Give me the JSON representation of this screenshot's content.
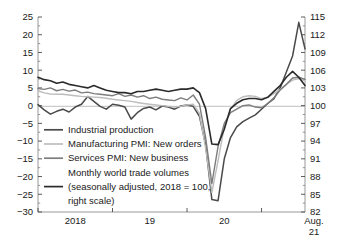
{
  "chart_data": {
    "type": "line",
    "title": "",
    "subtitle": "",
    "xlabel": "",
    "ylabel": "",
    "grid": false,
    "legend_position": "inside-lower-left",
    "x_tick_labels": [
      "2018",
      "19",
      "20",
      "Aug.",
      "21"
    ],
    "left_axis": {
      "label": "",
      "ylim": [
        -30,
        25
      ],
      "ticks": [
        25,
        20,
        15,
        10,
        5,
        0,
        -5,
        -10,
        -15,
        -20,
        -25,
        -30
      ],
      "tick_labels": [
        "25",
        "20",
        "15",
        "10",
        "5",
        "0",
        "−5",
        "−10",
        "−15",
        "−20",
        "−25",
        "−30"
      ]
    },
    "right_axis": {
      "label": "",
      "ylim": [
        82,
        115
      ],
      "ticks": [
        115,
        112,
        109,
        106,
        103,
        100,
        97,
        94,
        91,
        88,
        85,
        82
      ],
      "tick_labels": [
        "115",
        "112",
        "109",
        "106",
        "103",
        "100",
        "97",
        "94",
        "91",
        "88",
        "85",
        "82"
      ]
    },
    "zero_line_value": 0,
    "series": [
      {
        "name": "Industrial production",
        "axis": "left",
        "color": "#4a4a4a",
        "width": 1.5,
        "x": [
          0,
          1,
          2,
          3,
          4,
          5,
          6,
          7,
          8,
          9,
          10,
          11,
          12,
          13,
          14,
          15,
          16,
          17,
          18,
          19,
          20,
          21,
          22,
          23,
          24,
          25,
          26,
          27,
          28,
          29,
          30,
          31,
          32,
          33,
          34,
          35,
          36,
          37,
          38,
          39,
          40,
          41,
          42,
          43
        ],
        "values": [
          0.3,
          -1.2,
          -2.4,
          -1.6,
          -1.0,
          -1.8,
          -0.4,
          0.4,
          2.6,
          1.2,
          -0.2,
          -1.0,
          0.4,
          0.1,
          -0.4,
          -3.8,
          -2.0,
          -0.8,
          -0.4,
          -1.2,
          -0.1,
          -0.4,
          -1.0,
          -0.1,
          0.2,
          -0.2,
          -3.0,
          -11.0,
          -26.5,
          -26.8,
          -15.0,
          -9.0,
          -6.0,
          -4.5,
          -3.5,
          -2.6,
          -1.0,
          0.6,
          2.0,
          5.0,
          9.5,
          14.0,
          23.5,
          16.0
        ]
      },
      {
        "name": "Manufacturing PMI: New orders",
        "axis": "left",
        "color": "#bdbdbd",
        "width": 1.4,
        "x": [
          0,
          1,
          2,
          3,
          4,
          5,
          6,
          7,
          8,
          9,
          10,
          11,
          12,
          13,
          14,
          15,
          16,
          17,
          18,
          19,
          20,
          21,
          22,
          23,
          24,
          25,
          26,
          27,
          28,
          29,
          30,
          31,
          32,
          33,
          34,
          35,
          36,
          37,
          38,
          39,
          40,
          41,
          42,
          43
        ],
        "values": [
          4.2,
          3.6,
          3.3,
          3.2,
          3.2,
          3.0,
          2.8,
          2.6,
          2.5,
          2.4,
          2.3,
          2.1,
          1.8,
          1.6,
          1.4,
          1.2,
          0.9,
          0.6,
          0.4,
          0.2,
          0.0,
          -0.2,
          -0.4,
          -0.2,
          0.2,
          0.4,
          -2.2,
          -12.0,
          -24.5,
          -15.5,
          -6.0,
          -1.0,
          1.5,
          2.5,
          2.8,
          2.6,
          2.0,
          2.4,
          3.4,
          4.6,
          6.0,
          7.2,
          7.6,
          7.0
        ]
      },
      {
        "name": "Services PMI: New business",
        "axis": "left",
        "color": "#7d7d7d",
        "width": 1.4,
        "x": [
          0,
          1,
          2,
          3,
          4,
          5,
          6,
          7,
          8,
          9,
          10,
          11,
          12,
          13,
          14,
          15,
          16,
          17,
          18,
          19,
          20,
          21,
          22,
          23,
          24,
          25,
          26,
          27,
          28,
          29,
          30,
          31,
          32,
          33,
          34,
          35,
          36,
          37,
          38,
          39,
          40,
          41,
          42,
          43
        ],
        "values": [
          4.8,
          4.6,
          5.0,
          4.2,
          4.6,
          4.1,
          4.4,
          3.6,
          3.8,
          3.4,
          3.2,
          3.0,
          2.8,
          3.4,
          2.6,
          3.0,
          2.4,
          2.8,
          2.0,
          2.4,
          1.8,
          1.6,
          1.4,
          2.2,
          1.6,
          3.0,
          0.4,
          -9.0,
          -22.0,
          -11.5,
          -5.0,
          -2.0,
          -1.0,
          0.0,
          0.2,
          -0.4,
          -0.6,
          0.6,
          2.2,
          4.4,
          6.0,
          7.8,
          8.0,
          7.4
        ]
      },
      {
        "name": "Monthly world trade volumes",
        "axis": "right",
        "color": "#2b2b2b",
        "width": 1.6,
        "x": [
          0,
          1,
          2,
          3,
          4,
          5,
          6,
          7,
          8,
          9,
          10,
          11,
          12,
          13,
          14,
          15,
          16,
          17,
          18,
          19,
          20,
          21,
          22,
          23,
          24,
          25,
          26,
          27,
          28,
          29,
          30,
          31,
          32,
          33,
          34,
          35,
          36,
          37,
          38,
          39,
          40,
          41,
          42,
          43
        ],
        "values": [
          104.8,
          104.4,
          104.2,
          103.8,
          104.0,
          103.6,
          103.4,
          103.2,
          103.0,
          103.4,
          103.0,
          102.6,
          102.4,
          102.2,
          102.2,
          102.0,
          102.4,
          102.4,
          102.6,
          102.8,
          102.6,
          102.4,
          102.6,
          102.8,
          102.8,
          103.0,
          102.2,
          99.5,
          93.5,
          93.4,
          96.0,
          99.5,
          100.4,
          101.0,
          101.2,
          101.2,
          101.0,
          101.4,
          102.4,
          103.4,
          104.8,
          105.8,
          104.8,
          103.4
        ]
      }
    ],
    "legend_entries": [
      {
        "label": "Industrial production",
        "color": "#4a4a4a",
        "swatch": true
      },
      {
        "label": "Manufacturing PMI: New orders",
        "color": "#bdbdbd",
        "swatch": true
      },
      {
        "label": "Services PMI: New business",
        "color": "#7d7d7d",
        "swatch": true
      },
      {
        "label": "Monthly world trade volumes",
        "color": "#2b2b2b",
        "swatch": false
      },
      {
        "label": "(seasonally adjusted, 2018 = 100,",
        "color": "#2b2b2b",
        "swatch": true
      },
      {
        "label": "right scale)",
        "color": "#2b2b2b",
        "swatch": false
      }
    ]
  }
}
